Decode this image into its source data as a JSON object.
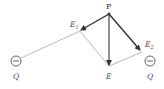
{
  "diagram": {
    "title": "",
    "point": {
      "label": "P"
    },
    "charges": [
      {
        "id": "left",
        "label": "Q",
        "sign": "−"
      },
      {
        "id": "right",
        "label": "Q",
        "sign": "−"
      }
    ],
    "vectors": [
      {
        "id": "E1",
        "label": "E",
        "subscript": "1",
        "description": "field from left charge"
      },
      {
        "id": "E2",
        "label": "E",
        "subscript": "2",
        "description": "field from right charge"
      },
      {
        "id": "E",
        "label": "E",
        "subscript": "",
        "description": "resultant field"
      }
    ],
    "colors": {
      "vector": "#333333",
      "construction": "#9a9a9a",
      "charge": "#555555"
    }
  }
}
